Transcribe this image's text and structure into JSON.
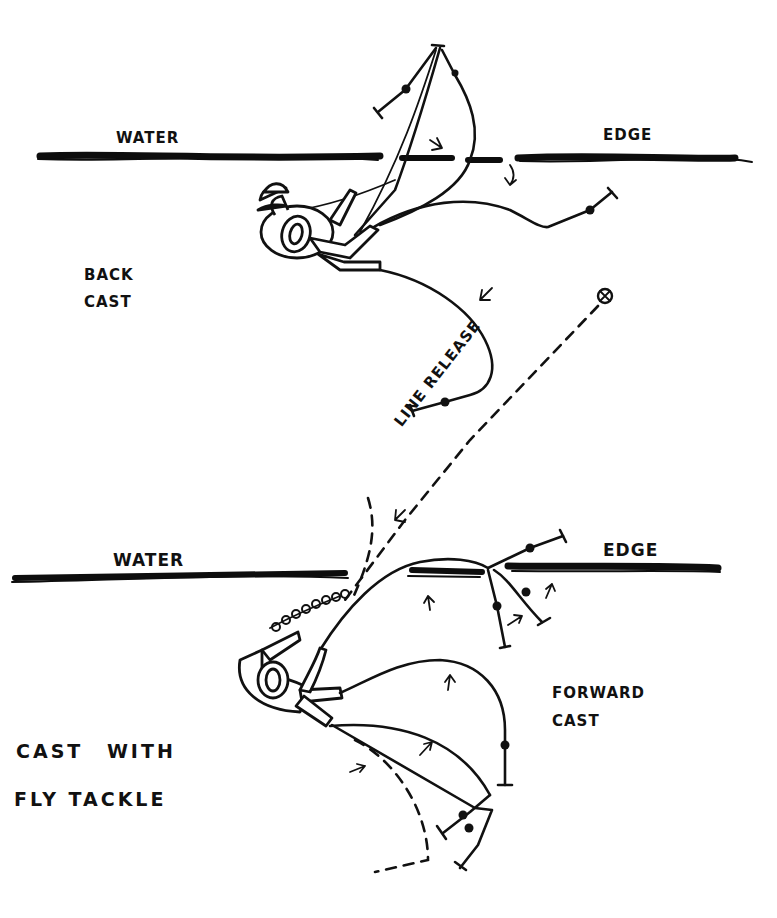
{
  "diagram": {
    "title_lines": [
      "CAST WITH",
      "FLY TACKLE"
    ],
    "top_panel": {
      "name": "BACK CAST",
      "label_lines": [
        "BACK",
        "CAST"
      ],
      "water_labels": {
        "left": "WATER",
        "right": "EDGE"
      },
      "release_marker": "⊗"
    },
    "middle": {
      "release_label": "LINE RELEASE"
    },
    "bottom_panel": {
      "name": "FORWARD CAST",
      "label_lines": [
        "FORWARD",
        "CAST"
      ],
      "water_labels": {
        "left": "WATER",
        "right": "EDGE"
      }
    },
    "colors": {
      "ink": "#111111",
      "paper": "#ffffff"
    }
  }
}
